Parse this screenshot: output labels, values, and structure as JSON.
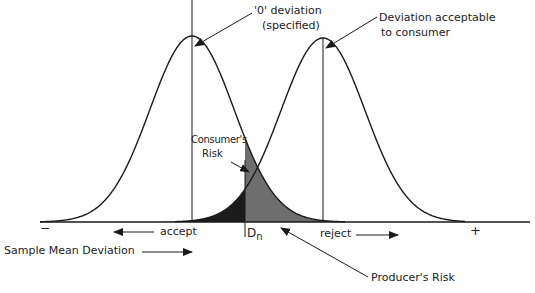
{
  "diagram": {
    "type": "overlapping normal distributions (acceptance sampling)",
    "colors": {
      "line": "#1a1a1a",
      "consumers_risk_fill": "#1c1c1c",
      "producers_risk_fill": "#6e6e6e",
      "background": "#ffffff"
    },
    "labels": {
      "zero_deviation": "'0' deviation",
      "zero_deviation_sub": "(specified)",
      "acceptable_deviation": "Deviation acceptable",
      "acceptable_deviation_sub": "to consumer",
      "consumers_risk_line1": "Consumer's",
      "consumers_risk_line2": "Risk",
      "producers_risk": "Producer's Risk",
      "accept": "accept",
      "reject": "reject",
      "threshold": "D",
      "threshold_sub": "n",
      "minus": "−",
      "plus": "+",
      "axis_title": "Sample Mean Deviation"
    },
    "curves": [
      {
        "name": "specified distribution",
        "mean_x": 192,
        "peak_y": 36
      },
      {
        "name": "consumer acceptable distribution",
        "mean_x": 323,
        "peak_y": 38
      }
    ],
    "threshold_x": 245
  }
}
